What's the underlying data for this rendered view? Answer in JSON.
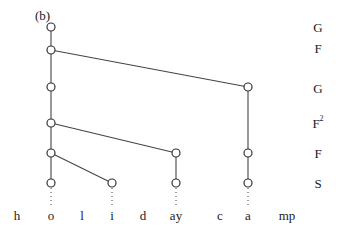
{
  "panel_label": "(b)",
  "tier_labels": [
    {
      "text": "G",
      "sup": "",
      "y": 27
    },
    {
      "text": "F",
      "sup": "",
      "y": 48
    },
    {
      "text": "G",
      "sup": "",
      "y": 88
    },
    {
      "text": "F",
      "sup": "2",
      "y": 123
    },
    {
      "text": "F",
      "sup": "",
      "y": 153
    },
    {
      "text": "S",
      "sup": "",
      "y": 183
    }
  ],
  "segments": [
    {
      "text": "h",
      "x": 17
    },
    {
      "text": "o",
      "x": 51
    },
    {
      "text": "l",
      "x": 82
    },
    {
      "text": "i",
      "x": 112
    },
    {
      "text": "d",
      "x": 143
    },
    {
      "text": "ay",
      "x": 176
    },
    {
      "text": "c",
      "x": 220
    },
    {
      "text": "a",
      "x": 248
    },
    {
      "text": "mp",
      "x": 287
    }
  ],
  "nodes": [
    {
      "id": "n_top",
      "x": 51,
      "y": 27
    },
    {
      "id": "n_F1",
      "x": 51,
      "y": 50
    },
    {
      "id": "n_G2a",
      "x": 51,
      "y": 87
    },
    {
      "id": "n_G2b",
      "x": 248,
      "y": 87
    },
    {
      "id": "n_F2",
      "x": 51,
      "y": 123
    },
    {
      "id": "n_Fa",
      "x": 51,
      "y": 153
    },
    {
      "id": "n_Fb",
      "x": 176,
      "y": 153
    },
    {
      "id": "n_Fc",
      "x": 248,
      "y": 153
    },
    {
      "id": "n_So",
      "x": 51,
      "y": 183
    },
    {
      "id": "n_Si",
      "x": 112,
      "y": 183
    },
    {
      "id": "n_Say",
      "x": 176,
      "y": 183
    },
    {
      "id": "n_Sa",
      "x": 248,
      "y": 183
    }
  ],
  "edges": [
    [
      "n_top",
      "n_F1"
    ],
    [
      "n_F1",
      "n_G2a"
    ],
    [
      "n_F1",
      "n_G2b"
    ],
    [
      "n_G2a",
      "n_F2"
    ],
    [
      "n_F2",
      "n_Fa"
    ],
    [
      "n_F2",
      "n_Fb"
    ],
    [
      "n_G2b",
      "n_Fc"
    ],
    [
      "n_Fa",
      "n_So"
    ],
    [
      "n_Fa",
      "n_Si"
    ],
    [
      "n_Fb",
      "n_Say"
    ],
    [
      "n_Fc",
      "n_Sa"
    ]
  ],
  "association_lines": [
    {
      "from": "n_So",
      "segment_x": 51
    },
    {
      "from": "n_Si",
      "segment_x": 112
    },
    {
      "from": "n_Say",
      "segment_x": 176
    },
    {
      "from": "n_Sa",
      "segment_x": 248
    }
  ],
  "style": {
    "line_color": "#444444",
    "node_fill": "#ffffff",
    "node_stroke": "#333333",
    "text_color": "#1a1a1a"
  }
}
